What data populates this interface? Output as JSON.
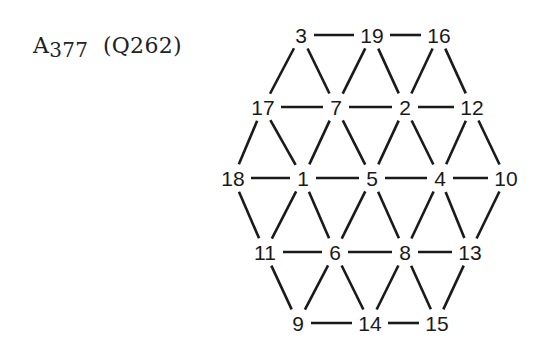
{
  "title": {
    "main": "A",
    "number": "377",
    "paren": "(Q262)"
  },
  "graph": {
    "nodes": [
      {
        "id": "3",
        "x": 301,
        "y": 35
      },
      {
        "id": "19",
        "x": 372,
        "y": 35
      },
      {
        "id": "16",
        "x": 439,
        "y": 35
      },
      {
        "id": "17",
        "x": 263,
        "y": 107
      },
      {
        "id": "7",
        "x": 336,
        "y": 107
      },
      {
        "id": "2",
        "x": 405,
        "y": 107
      },
      {
        "id": "12",
        "x": 472,
        "y": 107
      },
      {
        "id": "18",
        "x": 233,
        "y": 178
      },
      {
        "id": "1",
        "x": 303,
        "y": 178
      },
      {
        "id": "5",
        "x": 372,
        "y": 178
      },
      {
        "id": "4",
        "x": 440,
        "y": 178
      },
      {
        "id": "10",
        "x": 506,
        "y": 178
      },
      {
        "id": "11",
        "x": 265,
        "y": 252
      },
      {
        "id": "6",
        "x": 335,
        "y": 252
      },
      {
        "id": "8",
        "x": 405,
        "y": 252
      },
      {
        "id": "13",
        "x": 470,
        "y": 252
      },
      {
        "id": "9",
        "x": 298,
        "y": 323
      },
      {
        "id": "14",
        "x": 370,
        "y": 323
      },
      {
        "id": "15",
        "x": 437,
        "y": 323
      }
    ],
    "edges": [
      [
        "3",
        "19"
      ],
      [
        "19",
        "16"
      ],
      [
        "17",
        "7"
      ],
      [
        "7",
        "2"
      ],
      [
        "2",
        "12"
      ],
      [
        "18",
        "1"
      ],
      [
        "1",
        "5"
      ],
      [
        "5",
        "4"
      ],
      [
        "4",
        "10"
      ],
      [
        "11",
        "6"
      ],
      [
        "6",
        "8"
      ],
      [
        "8",
        "13"
      ],
      [
        "9",
        "14"
      ],
      [
        "14",
        "15"
      ],
      [
        "3",
        "17"
      ],
      [
        "3",
        "7"
      ],
      [
        "19",
        "7"
      ],
      [
        "19",
        "2"
      ],
      [
        "16",
        "2"
      ],
      [
        "16",
        "12"
      ],
      [
        "17",
        "18"
      ],
      [
        "17",
        "1"
      ],
      [
        "7",
        "1"
      ],
      [
        "7",
        "5"
      ],
      [
        "2",
        "5"
      ],
      [
        "2",
        "4"
      ],
      [
        "12",
        "4"
      ],
      [
        "12",
        "10"
      ],
      [
        "18",
        "11"
      ],
      [
        "1",
        "11"
      ],
      [
        "1",
        "6"
      ],
      [
        "5",
        "6"
      ],
      [
        "5",
        "8"
      ],
      [
        "4",
        "8"
      ],
      [
        "4",
        "13"
      ],
      [
        "10",
        "13"
      ],
      [
        "11",
        "9"
      ],
      [
        "6",
        "9"
      ],
      [
        "6",
        "14"
      ],
      [
        "8",
        "14"
      ],
      [
        "8",
        "15"
      ],
      [
        "13",
        "15"
      ]
    ]
  }
}
